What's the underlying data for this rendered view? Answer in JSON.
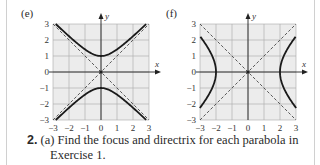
{
  "panels": [
    {
      "label": "(e)",
      "curve": "hyperbola-vertical",
      "equation_hint": "y^2 - x^2 = 1"
    },
    {
      "label": "(f)",
      "curve": "hyperbola-horizontal",
      "equation_hint": "x^2/4 - y^2/4 = 1"
    }
  ],
  "axes": {
    "x_label": "x",
    "y_label": "y",
    "x_ticks": [
      "−3",
      "−2",
      "−1",
      "0",
      "1",
      "2",
      "3"
    ],
    "y_ticks": [
      "3",
      "2",
      "1",
      "0",
      "−1",
      "−2",
      "−3"
    ]
  },
  "exercise": {
    "number": "2.",
    "part": "(a)",
    "text_line1": "Find the focus and directrix for each parabola in",
    "text_line2": "Exercise 1."
  },
  "colors": {
    "grid_bg": "#ececec",
    "grid_line": "#a9a9a9",
    "curve": "#1a1a1a"
  }
}
